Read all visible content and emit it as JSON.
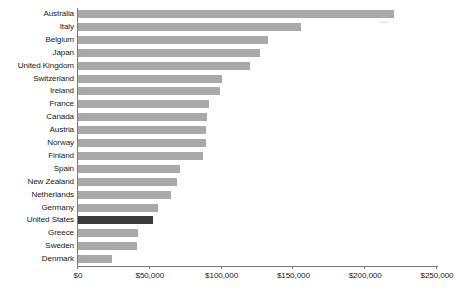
{
  "chart_data": {
    "type": "bar",
    "orientation": "horizontal",
    "title": "",
    "subtitle": "",
    "xlabel": "",
    "ylabel": "",
    "xlim": [
      0,
      250000
    ],
    "grid": false,
    "legend": null,
    "tick_labels": [
      "$0",
      "$50,000",
      "$100,000",
      "$150,000",
      "$200,000",
      "$250,000"
    ],
    "tick_values": [
      0,
      50000,
      100000,
      150000,
      200000,
      250000
    ],
    "categories": [
      "Australia",
      "Italy",
      "Belgium",
      "Japan",
      "United Kingdom",
      "Switzerland",
      "Ireland",
      "France",
      "Canada",
      "Austria",
      "Norway",
      "Finland",
      "Spain",
      "New Zealand",
      "Netherlands",
      "Germany",
      "United States",
      "Greece",
      "Sweden",
      "Denmark"
    ],
    "values": [
      220000,
      155000,
      132000,
      127000,
      120000,
      100000,
      99000,
      91000,
      90000,
      89000,
      89000,
      87000,
      71000,
      69000,
      65000,
      56000,
      52000,
      42000,
      41000,
      24000
    ],
    "highlight_category": "United States",
    "colors": {
      "bar": "#a9a9a9",
      "bar_highlight": "#3b3b3b",
      "axis": "#7a7a7a",
      "text": "#1a1a1a",
      "background": "#ffffff"
    }
  }
}
